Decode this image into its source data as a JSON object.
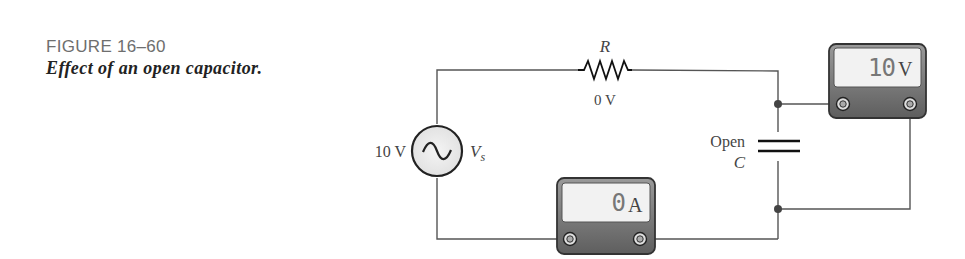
{
  "figure": {
    "number": "FIGURE 16–60",
    "title": "Effect of an open capacitor."
  },
  "circuit": {
    "source": {
      "value": "10 V",
      "symbol": "V",
      "subscript": "s",
      "type": "ac-sine"
    },
    "resistor": {
      "label": "R",
      "voltage": "0 V"
    },
    "capacitor": {
      "state": "Open",
      "label": "C"
    },
    "voltmeter": {
      "reading": "10",
      "unit": "V",
      "position": "across capacitor"
    },
    "ammeter": {
      "reading": "0",
      "unit": "A",
      "position": "in series, bottom wire"
    }
  }
}
